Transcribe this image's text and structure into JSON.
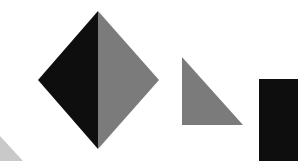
{
  "colors": {
    "background": "#ffffff",
    "black": "#0e0e0e",
    "gray": "#7b7b7b",
    "light_gray": "#c9c9c9"
  },
  "shapes": [
    {
      "name": "diamond-left-half",
      "type": "triangle",
      "color": "black",
      "points": "98,11 38,80 98,149"
    },
    {
      "name": "diamond-right-half",
      "type": "triangle",
      "color": "gray",
      "points": "98,11 159,80 98,149"
    },
    {
      "name": "right-triangle",
      "type": "triangle",
      "color": "gray",
      "points": "182,57 182,125 243,125"
    },
    {
      "name": "black-rectangle",
      "type": "rect",
      "color": "black",
      "points": "259,79 298,79 298,161 259,161"
    },
    {
      "name": "light-corner-shape",
      "type": "polygon",
      "color": "light_gray",
      "points": "0,136 23,161 0,161"
    }
  ]
}
